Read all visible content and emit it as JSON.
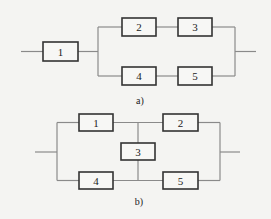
{
  "diagram_a": {
    "caption": "a)",
    "blocks": [
      {
        "id": "1",
        "label": "1",
        "x": 43,
        "y": 42,
        "w": 35,
        "h": 19
      },
      {
        "id": "2",
        "label": "2",
        "x": 122,
        "y": 18,
        "w": 34,
        "h": 18
      },
      {
        "id": "3",
        "label": "3",
        "x": 178,
        "y": 18,
        "w": 34,
        "h": 18
      },
      {
        "id": "4",
        "label": "4",
        "x": 122,
        "y": 67,
        "w": 34,
        "h": 18
      },
      {
        "id": "5",
        "label": "5",
        "x": 178,
        "y": 67,
        "w": 34,
        "h": 18
      }
    ],
    "structure": "1 in series with parallel( series(2,3), series(4,5) )"
  },
  "diagram_b": {
    "caption": "b)",
    "blocks": [
      {
        "id": "1",
        "label": "1",
        "x": 79,
        "y": 114,
        "w": 34,
        "h": 17
      },
      {
        "id": "2",
        "label": "2",
        "x": 163,
        "y": 114,
        "w": 35,
        "h": 17
      },
      {
        "id": "3",
        "label": "3",
        "x": 121,
        "y": 143,
        "w": 34,
        "h": 17
      },
      {
        "id": "4",
        "label": "4",
        "x": 79,
        "y": 172,
        "w": 34,
        "h": 17
      },
      {
        "id": "5",
        "label": "5",
        "x": 163,
        "y": 172,
        "w": 35,
        "h": 17
      }
    ],
    "structure": "bridge network: 1-2 top path, 4-5 bottom path, 3 bridging between midpoints"
  }
}
